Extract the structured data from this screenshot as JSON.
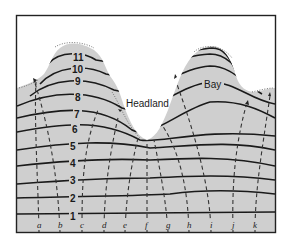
{
  "diagram": {
    "type": "wave refraction along an irregular coastline",
    "labels": {
      "headland": "Headland",
      "bay": "Bay"
    },
    "wave_crests": [
      "1",
      "2",
      "3",
      "4",
      "5",
      "6",
      "7",
      "8",
      "9",
      "10",
      "11"
    ],
    "orthogonals": [
      "a",
      "b",
      "c",
      "d",
      "e",
      "f",
      "g",
      "h",
      "i",
      "j",
      "k"
    ],
    "colors": {
      "water": "#cfcfcf",
      "land": "#ffffff",
      "crest_line": "#1a1a1a",
      "orthogonal_line": "#333333",
      "frame": "#222222"
    }
  }
}
